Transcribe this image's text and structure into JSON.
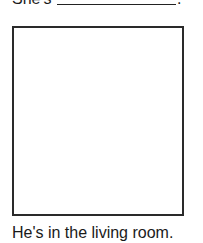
{
  "exercise": {
    "prompt_prefix": "She's",
    "prompt_suffix": ".",
    "blank_answer": "",
    "caption": "He's in the living room."
  }
}
